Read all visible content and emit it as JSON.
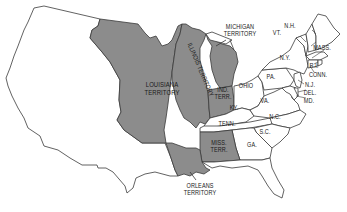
{
  "map": {
    "colors": {
      "territory_fill": "#8c8c8c",
      "state_fill": "#ffffff",
      "border": "#3a3a3a",
      "background": "#ffffff"
    },
    "labels": {
      "louisiana_1": "LOUISIANA",
      "louisiana_2": "TERRITORY",
      "illinois": "ILLINOIS TERRITORY",
      "michigan_1": "MICHIGAN",
      "michigan_2": "TERRITORY",
      "indiana_1": "IND.",
      "indiana_2": "TERR.",
      "ohio": "OHIO",
      "ky": "KY.",
      "tenn": "TENN.",
      "miss_1": "MISS.",
      "miss_2": "TERR.",
      "orleans_1": "ORLEANS",
      "orleans_2": "TERRITORY",
      "ga": "GA.",
      "sc": "S.C.",
      "nc": "N.C.",
      "va": "VA.",
      "pa": "PA.",
      "ny": "N.Y.",
      "vt": "VT.",
      "nh": "N.H.",
      "mass": "MASS.",
      "ri": "R.I.",
      "conn": "CONN.",
      "nj": "N.J.",
      "del": "DEL.",
      "md": "MD."
    }
  }
}
